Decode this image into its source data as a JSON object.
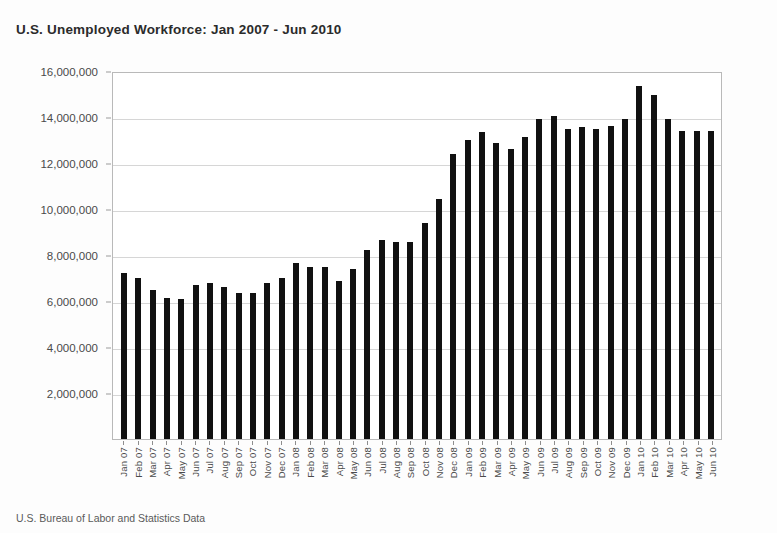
{
  "chart_data": {
    "type": "bar",
    "title": "U.S. Unemployed Workforce: Jan 2007 -  Jun 2010",
    "source_note": "U.S. Bureau of Labor and Statistics Data",
    "xlabel": "",
    "ylabel": "",
    "ylim": [
      0,
      16000000
    ],
    "grid": true,
    "legend": "none",
    "bar_color": "#111111",
    "grid_color": "#d6d6d6",
    "y_ticks": [
      "16,000,000",
      "14,000,000",
      "12,000,000",
      "10,000,000",
      "8,000,000",
      "6,000,000",
      "4,000,000",
      "2,000,000"
    ],
    "y_tick_values": [
      16000000,
      14000000,
      12000000,
      10000000,
      8000000,
      6000000,
      4000000,
      2000000
    ],
    "categories": [
      "Jan 07",
      "Feb 07",
      "Mar 07",
      "Apr 07",
      "May 07",
      "Jun 07",
      "Jul 07",
      "Aug 07",
      "Sep 07",
      "Oct 07",
      "Nov 07",
      "Dec 07",
      "Jan 08",
      "Feb 08",
      "Mar 08",
      "Apr 08",
      "May 08",
      "Jun 08",
      "Jul 08",
      "Aug 08",
      "Sep 08",
      "Oct 08",
      "Nov 08",
      "Dec 08",
      "Jan 09",
      "Feb 09",
      "Mar 09",
      "Apr 09",
      "May 09",
      "Jun 09",
      "Jul 09",
      "Aug 09",
      "Sep 09",
      "Oct 09",
      "Nov 09",
      "Dec 09",
      "Jan 10",
      "Feb 10",
      "Mar 10",
      "Apr 10",
      "May 10",
      "Jun 10"
    ],
    "values": [
      7200000,
      7000000,
      6500000,
      6150000,
      6100000,
      6700000,
      6800000,
      6600000,
      6350000,
      6350000,
      6800000,
      7000000,
      7650000,
      7500000,
      7500000,
      6850000,
      7400000,
      8200000,
      8650000,
      8550000,
      8550000,
      9400000,
      10450000,
      12400000,
      13000000,
      13350000,
      12850000,
      12600000,
      13150000,
      13900000,
      14050000,
      13500000,
      13550000,
      13500000,
      13600000,
      13900000,
      15350000,
      14950000,
      13900000,
      13400000,
      13400000,
      13400000
    ]
  }
}
